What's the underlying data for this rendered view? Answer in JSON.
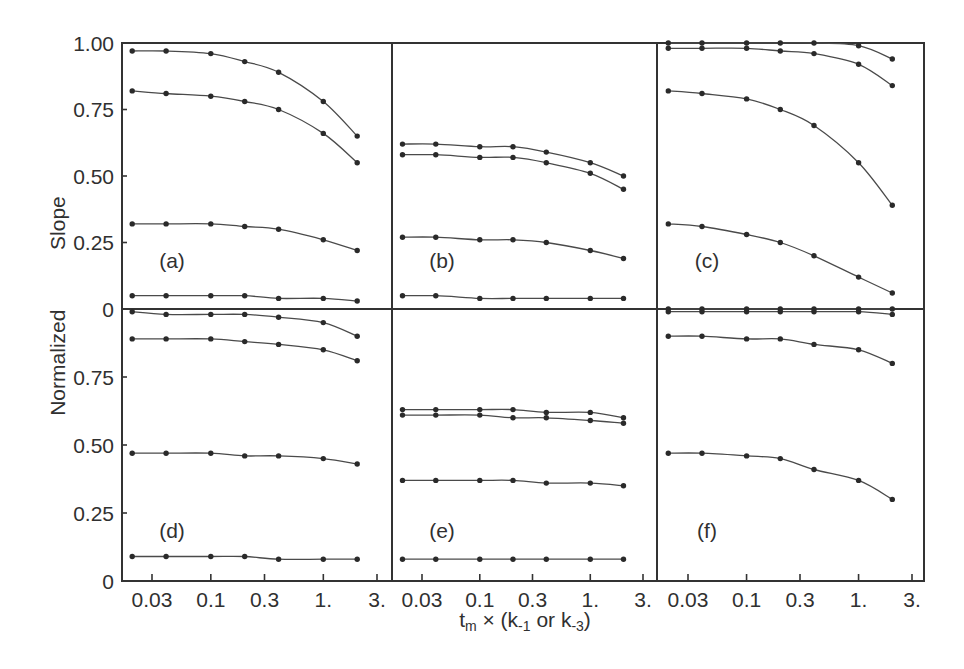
{
  "figure": {
    "ylabel": "Normalized  Slope",
    "xlabel_parts": {
      "t": "t",
      "t_sub": "m",
      "times": " × (k",
      "k1_sub": "-1",
      "or": " or k",
      "k3_sub": "-3",
      "close": ")"
    },
    "y_tick_values_top": [
      1.0,
      0.75,
      0.5,
      0.25,
      0
    ],
    "y_ticks_top": [
      "1.00",
      "0.75",
      "0.50",
      "0.25",
      "0"
    ],
    "y_tick_values_bottom": [
      0.75,
      0.5,
      0.25,
      0
    ],
    "y_ticks_bottom": [
      "0.75",
      "0.50",
      "0.25",
      "0"
    ],
    "x_tick_values": [
      0.03,
      0.1,
      0.3,
      1,
      3
    ],
    "x_tick_labels": [
      "0.03",
      "0.1",
      "0.3",
      "1.",
      "3."
    ]
  },
  "chart_data": [
    {
      "type": "line",
      "title": "(a)",
      "xscale": "log",
      "xlabel": "t_m × (k_-1 or k_-3)",
      "ylabel": "Normalized Slope",
      "xlim": [
        0.016,
        4
      ],
      "ylim": [
        0,
        1
      ],
      "x": [
        0.02,
        0.04,
        0.1,
        0.2,
        0.4,
        1,
        2
      ],
      "series": [
        {
          "values": [
            0.97,
            0.97,
            0.96,
            0.93,
            0.89,
            0.78,
            0.65
          ]
        },
        {
          "values": [
            0.82,
            0.81,
            0.8,
            0.78,
            0.75,
            0.66,
            0.55
          ]
        },
        {
          "values": [
            0.32,
            0.32,
            0.32,
            0.31,
            0.3,
            0.26,
            0.22
          ]
        },
        {
          "values": [
            0.05,
            0.05,
            0.05,
            0.05,
            0.04,
            0.04,
            0.03
          ]
        }
      ]
    },
    {
      "type": "line",
      "title": "(b)",
      "xscale": "log",
      "xlabel": "t_m × (k_-1 or k_-3)",
      "ylabel": "Normalized Slope",
      "xlim": [
        0.016,
        4
      ],
      "ylim": [
        0,
        1
      ],
      "x": [
        0.02,
        0.04,
        0.1,
        0.2,
        0.4,
        1,
        2
      ],
      "series": [
        {
          "values": [
            0.62,
            0.62,
            0.61,
            0.61,
            0.59,
            0.55,
            0.5
          ]
        },
        {
          "values": [
            0.58,
            0.58,
            0.57,
            0.57,
            0.55,
            0.51,
            0.45
          ]
        },
        {
          "values": [
            0.27,
            0.27,
            0.26,
            0.26,
            0.25,
            0.22,
            0.19
          ]
        },
        {
          "values": [
            0.05,
            0.05,
            0.04,
            0.04,
            0.04,
            0.04,
            0.04
          ]
        }
      ]
    },
    {
      "type": "line",
      "title": "(c)",
      "xscale": "log",
      "xlabel": "t_m × (k_-1 or k_-3)",
      "ylabel": "Normalized Slope",
      "xlim": [
        0.016,
        4
      ],
      "ylim": [
        0,
        1
      ],
      "x": [
        0.02,
        0.04,
        0.1,
        0.2,
        0.4,
        1,
        2
      ],
      "series": [
        {
          "values": [
            1.0,
            1.0,
            1.0,
            1.0,
            1.0,
            0.99,
            0.94
          ]
        },
        {
          "values": [
            0.98,
            0.98,
            0.98,
            0.97,
            0.96,
            0.92,
            0.84
          ]
        },
        {
          "values": [
            0.82,
            0.81,
            0.79,
            0.75,
            0.69,
            0.55,
            0.39
          ]
        },
        {
          "values": [
            0.32,
            0.31,
            0.28,
            0.25,
            0.2,
            0.12,
            0.06
          ]
        }
      ]
    },
    {
      "type": "line",
      "title": "(d)",
      "xscale": "log",
      "xlabel": "t_m × (k_-1 or k_-3)",
      "ylabel": "Normalized Slope",
      "xlim": [
        0.016,
        4
      ],
      "ylim": [
        0,
        1
      ],
      "x": [
        0.02,
        0.04,
        0.1,
        0.2,
        0.4,
        1,
        2
      ],
      "series": [
        {
          "values": [
            0.99,
            0.98,
            0.98,
            0.98,
            0.97,
            0.95,
            0.9
          ]
        },
        {
          "values": [
            0.89,
            0.89,
            0.89,
            0.88,
            0.87,
            0.85,
            0.81
          ]
        },
        {
          "values": [
            0.47,
            0.47,
            0.47,
            0.46,
            0.46,
            0.45,
            0.43
          ]
        },
        {
          "values": [
            0.09,
            0.09,
            0.09,
            0.09,
            0.08,
            0.08,
            0.08
          ]
        }
      ]
    },
    {
      "type": "line",
      "title": "(e)",
      "xscale": "log",
      "xlabel": "t_m × (k_-1 or k_-3)",
      "ylabel": "Normalized Slope",
      "xlim": [
        0.016,
        4
      ],
      "ylim": [
        0,
        1
      ],
      "x": [
        0.02,
        0.04,
        0.1,
        0.2,
        0.4,
        1,
        2
      ],
      "series": [
        {
          "values": [
            0.63,
            0.63,
            0.63,
            0.63,
            0.62,
            0.62,
            0.6
          ]
        },
        {
          "values": [
            0.61,
            0.61,
            0.61,
            0.6,
            0.6,
            0.59,
            0.58
          ]
        },
        {
          "values": [
            0.37,
            0.37,
            0.37,
            0.37,
            0.36,
            0.36,
            0.35
          ]
        },
        {
          "values": [
            0.08,
            0.08,
            0.08,
            0.08,
            0.08,
            0.08,
            0.08
          ]
        }
      ]
    },
    {
      "type": "line",
      "title": "(f)",
      "xscale": "log",
      "xlabel": "t_m × (k_-1 or k_-3)",
      "ylabel": "Normalized Slope",
      "xlim": [
        0.016,
        4
      ],
      "ylim": [
        0,
        1
      ],
      "x": [
        0.02,
        0.04,
        0.1,
        0.2,
        0.4,
        1,
        2
      ],
      "series": [
        {
          "values": [
            1.0,
            1.0,
            1.0,
            1.0,
            1.0,
            1.0,
            1.0
          ]
        },
        {
          "values": [
            0.99,
            0.99,
            0.99,
            0.99,
            0.99,
            0.99,
            0.98
          ]
        },
        {
          "values": [
            0.9,
            0.9,
            0.89,
            0.89,
            0.87,
            0.85,
            0.8
          ]
        },
        {
          "values": [
            0.47,
            0.47,
            0.46,
            0.45,
            0.41,
            0.37,
            0.3
          ]
        }
      ]
    }
  ]
}
